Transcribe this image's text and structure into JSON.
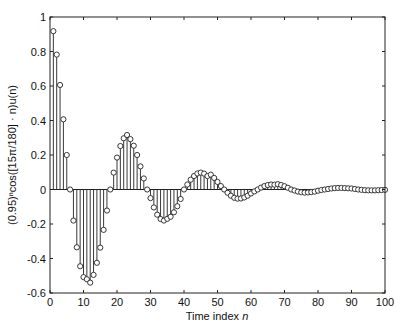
{
  "chart_data": {
    "type": "stem",
    "title": "",
    "xlabel": "Time index n",
    "xlabel_parts": {
      "text": "Time index ",
      "var": "n"
    },
    "ylabel": "(0.95)^n cos([15π/180] · n)u(n)",
    "xlim": [
      0,
      100
    ],
    "ylim": [
      -0.6,
      1
    ],
    "xticks": [
      0,
      10,
      20,
      30,
      40,
      50,
      60,
      70,
      80,
      90,
      100
    ],
    "xtick_labels": [
      "0",
      "10",
      "20",
      "30",
      "40",
      "50",
      "60",
      "70",
      "80",
      "90",
      "100"
    ],
    "yticks": [
      -0.6,
      -0.4,
      -0.2,
      0,
      0.2,
      0.4,
      0.6,
      0.8,
      1
    ],
    "ytick_labels": [
      "-0.6",
      "-0.4",
      "-0.2",
      "0",
      "0.2",
      "0.4",
      "0.6",
      "0.8",
      "1"
    ],
    "grid": false,
    "legend": null,
    "marker": "open-circle",
    "formula": "x(n) = 0.95^n * cos(15*pi/180 * n), n = 1..100",
    "x": [
      1,
      2,
      3,
      4,
      5,
      6,
      7,
      8,
      9,
      10,
      11,
      12,
      13,
      14,
      15,
      16,
      17,
      18,
      19,
      20,
      21,
      22,
      23,
      24,
      25,
      26,
      27,
      28,
      29,
      30,
      31,
      32,
      33,
      34,
      35,
      36,
      37,
      38,
      39,
      40,
      41,
      42,
      43,
      44,
      45,
      46,
      47,
      48,
      49,
      50,
      51,
      52,
      53,
      54,
      55,
      56,
      57,
      58,
      59,
      60,
      61,
      62,
      63,
      64,
      65,
      66,
      67,
      68,
      69,
      70,
      71,
      72,
      73,
      74,
      75,
      76,
      77,
      78,
      79,
      80,
      81,
      82,
      83,
      84,
      85,
      86,
      87,
      88,
      89,
      90,
      91,
      92,
      93,
      94,
      95,
      96,
      97,
      98,
      99,
      100
    ],
    "values": [
      0.918,
      0.782,
      0.606,
      0.407,
      0.2,
      0.0,
      -0.18,
      -0.335,
      -0.445,
      -0.508,
      -0.52,
      -0.54,
      -0.495,
      -0.425,
      -0.337,
      -0.234,
      -0.122,
      0.0,
      0.098,
      0.185,
      0.252,
      0.297,
      0.316,
      0.292,
      0.254,
      0.2,
      0.134,
      0.064,
      0.0,
      -0.05,
      -0.104,
      -0.146,
      -0.171,
      -0.18,
      -0.17,
      -0.158,
      -0.132,
      -0.097,
      -0.055,
      0.0,
      0.029,
      0.057,
      0.078,
      0.093,
      0.098,
      0.092,
      0.078,
      0.086,
      0.067,
      0.044,
      0.02,
      0.0,
      -0.019,
      -0.036,
      -0.048,
      -0.053,
      -0.052,
      -0.046,
      -0.036,
      -0.023,
      -0.011,
      0.0,
      0.011,
      0.02,
      0.026,
      0.029,
      0.028,
      0.031,
      0.026,
      0.019,
      0.01,
      0.0,
      -0.006,
      -0.012,
      -0.016,
      -0.018,
      -0.017,
      -0.015,
      -0.012,
      -0.007,
      -0.003,
      0.0,
      0.003,
      0.006,
      0.008,
      0.009,
      0.009,
      0.008,
      0.007,
      0.006,
      0.003,
      0.0,
      -0.002,
      -0.004,
      -0.005,
      -0.005,
      -0.005,
      -0.004,
      -0.003,
      -0.002
    ]
  },
  "axis_labels": {
    "x_text": "Time index ",
    "x_var": "n",
    "y_text": "(0.95)ⁿcos([15π/180] · n)u(n)"
  }
}
